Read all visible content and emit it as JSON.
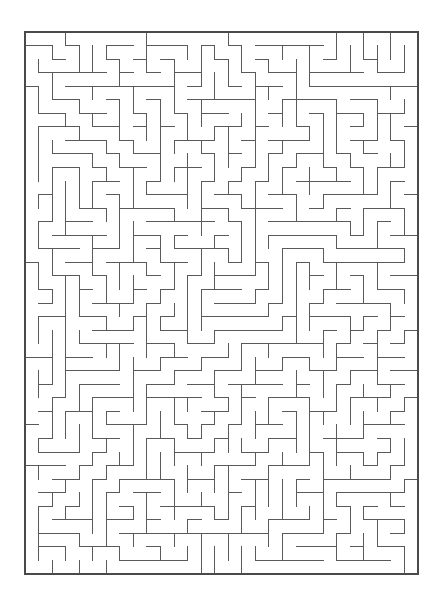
{
  "document": {
    "kind": "maze-puzzle",
    "background_color": "#ffffff",
    "page_width": 444,
    "page_height": 610
  },
  "maze": {
    "name": "rectangular-perfect-maze",
    "columns": 29,
    "rows": 40,
    "cell_size": 13.55,
    "origin_x": 25,
    "origin_y": 32,
    "width": 393,
    "height": 542,
    "wall_color": "#5a5a5a",
    "wall_thickness": 1,
    "border_color": "#4a4a4a",
    "border_thickness": 1.2,
    "background_color": "#ffffff",
    "entrance": {
      "side": "none",
      "index": 0
    },
    "exit": {
      "side": "none",
      "index": 0
    },
    "generator": {
      "algorithm": "recursive-backtracker",
      "seed": 20240517
    },
    "title": "",
    "caption": ""
  }
}
